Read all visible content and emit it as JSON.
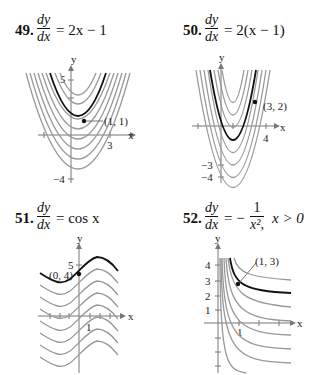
{
  "problems": [
    {
      "number": "49.",
      "lhs_num": "dy",
      "lhs_den": "dx",
      "rhs": "= 2x − 1",
      "graph": {
        "y_label": "y",
        "x_label": "x",
        "y_ticks_labeled": [
          "5",
          "−4"
        ],
        "x_ticks_labeled": [
          "3"
        ],
        "point_label": "(1, 1)"
      }
    },
    {
      "number": "50.",
      "lhs_num": "dy",
      "lhs_den": "dx",
      "rhs": "= 2(x − 1)",
      "graph": {
        "y_label": "y",
        "x_label": "x",
        "y_ticks_labeled": [
          "−3",
          "−4"
        ],
        "x_ticks_labeled": [
          "4"
        ],
        "point_label": "(3, 2)"
      }
    },
    {
      "number": "51.",
      "lhs_num": "dy",
      "lhs_den": "dx",
      "rhs": "= cos x",
      "graph": {
        "y_label": "y",
        "x_label": "x",
        "y_ticks_labeled": [
          "5"
        ],
        "x_ticks_labeled": [
          "1"
        ],
        "point_label": "(0, 4)"
      }
    },
    {
      "number": "52.",
      "lhs_num": "dy",
      "lhs_den": "dx",
      "rhs_a": "= −",
      "rhs_num": "1",
      "rhs_den": "x²,",
      "rhs_b": "x > 0",
      "graph": {
        "y_label": "y",
        "x_label": "x",
        "y_ticks_labeled": [
          "4",
          "3",
          "2",
          "1"
        ],
        "x_ticks_labeled": [
          "1"
        ],
        "point_label": "(1, 3)"
      }
    }
  ]
}
